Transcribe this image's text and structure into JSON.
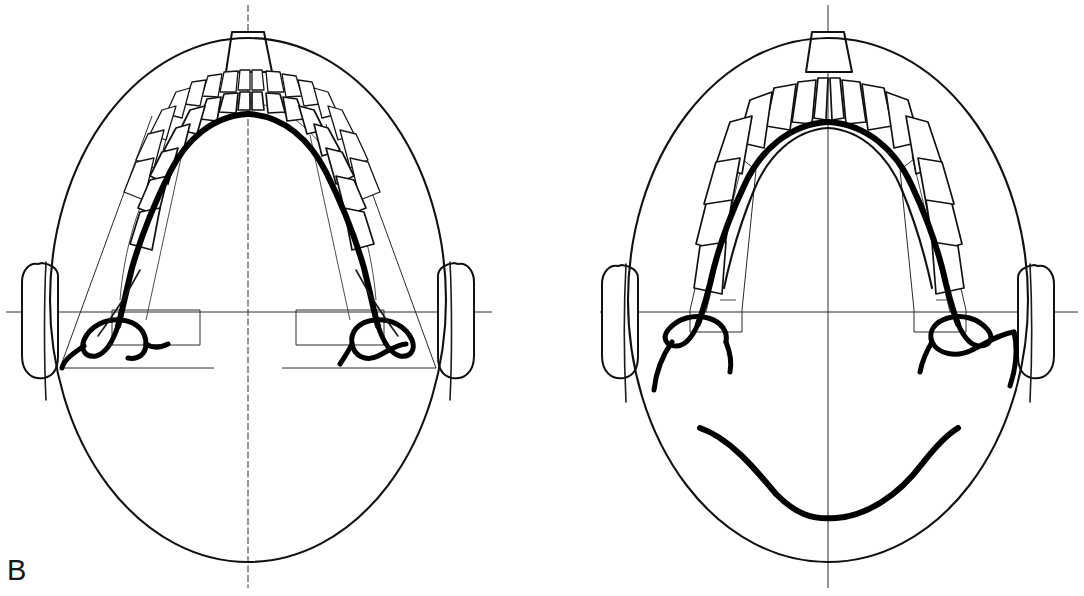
{
  "figure": {
    "label": "B",
    "label_position": "bottom-left",
    "background_color": "#ffffff",
    "ink_color": "#111111",
    "width": 1084,
    "height": 596,
    "panel_count": 2
  },
  "panels": [
    {
      "id": "left-panel",
      "name": "left-skull-tracing",
      "description": "Occlusal / submentovertex tracing of a skull showing a narrow tapered dental arch with bold mandibular outline superimposed on the maxillary arch",
      "cranium": {
        "center_x": 248,
        "center_y": 300,
        "radius_x": 198,
        "radius_y": 262
      },
      "midline": {
        "x": 248,
        "y_top": 5,
        "y_bottom": 588,
        "style": "dashed"
      },
      "transverse_line": {
        "y": 312,
        "x_start": 6,
        "x_end": 492,
        "style": "solid"
      },
      "nose": {
        "label": "nasal-prominence",
        "apex_y": 30,
        "base_y": 72,
        "top_width": 44,
        "base_width": 72
      },
      "ears": [
        {
          "side": "left",
          "label": "left-auricle"
        },
        {
          "side": "right",
          "label": "right-auricle"
        }
      ],
      "arch": {
        "type": "narrow-tapered",
        "teeth_upper_count": 16,
        "teeth_lower_count": 14,
        "apex_y": 80,
        "width": 156
      },
      "mandible_trace": {
        "weight": "bold",
        "label": "mandibular-outline-superimposed"
      },
      "ramus_guides": {
        "count": 2,
        "label": "ramus-construction-lines"
      }
    },
    {
      "id": "right-panel",
      "name": "right-skull-tracing",
      "description": "Occlusal / submentovertex tracing of a skull showing a broad ovoid dental arch, bold mandibular body curve, and posterior hyoid curve below the transverse line",
      "cranium": {
        "center_x": 828,
        "center_y": 300,
        "radius_x": 200,
        "radius_y": 262
      },
      "midline": {
        "x": 828,
        "y_top": 5,
        "y_bottom": 588,
        "style": "solid"
      },
      "transverse_line": {
        "y": 312,
        "x_start": 600,
        "x_end": 1078,
        "style": "solid"
      },
      "nose": {
        "label": "nasal-prominence",
        "apex_y": 30,
        "base_y": 72,
        "top_width": 44,
        "base_width": 72
      },
      "ears": [
        {
          "side": "left",
          "label": "left-auricle"
        },
        {
          "side": "right",
          "label": "right-auricle"
        }
      ],
      "arch": {
        "type": "broad-ovoid",
        "teeth_upper_count": 16,
        "teeth_lower_count": 10,
        "apex_y": 72,
        "width": 196
      },
      "mandible_trace": {
        "weight": "bold",
        "label": "mandibular-outline-superimposed"
      },
      "hyoid_curve": {
        "label": "posterior-mandibular-hyoid-curve",
        "y_apex": 508,
        "span_x": [
          718,
          980
        ]
      },
      "ramus_guides": {
        "count": 2,
        "label": "ramus-construction-lines"
      }
    }
  ],
  "legend": {
    "bold_line": "Mandibular tracing",
    "thin_line": "Maxillary / cranial tracing",
    "dashed_line": "Midsagittal reference axis"
  }
}
